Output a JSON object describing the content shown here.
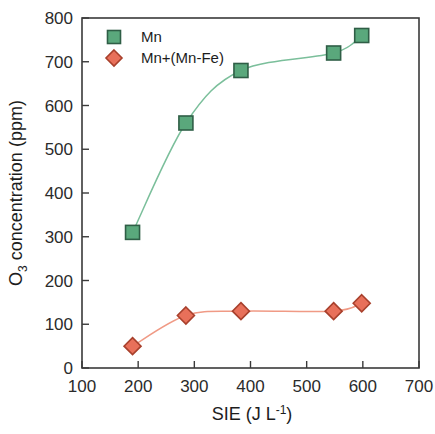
{
  "chart_data": {
    "type": "scatter",
    "title": "",
    "xlabel": "SIE (J L-1)",
    "xlabel_main": "SIE (J L",
    "xlabel_sup": "-1",
    "xlabel_close": ")",
    "ylabel": "O3 concentration (ppm)",
    "ylabel_main": "O",
    "ylabel_sub": "3",
    "ylabel_rest": " concentration (ppm)",
    "xlim": [
      100,
      700
    ],
    "ylim": [
      0,
      800
    ],
    "xticks": [
      100,
      200,
      300,
      400,
      500,
      600,
      700
    ],
    "yticks": [
      0,
      100,
      200,
      300,
      400,
      500,
      600,
      700,
      800
    ],
    "xtick_labels": [
      "100",
      "200",
      "300",
      "400",
      "500",
      "600",
      "700"
    ],
    "ytick_labels": [
      "0",
      "100",
      "200",
      "300",
      "400",
      "500",
      "600",
      "700",
      "800"
    ],
    "grid": false,
    "legend_position": "top-left",
    "series": [
      {
        "name": "Mn",
        "marker": "square",
        "color": "#5aa87c",
        "edge_color": "#2f5e46",
        "line_color": "#7bbf9b",
        "x": [
          190,
          285,
          383,
          548,
          598
        ],
        "y": [
          310,
          560,
          680,
          720,
          760
        ]
      },
      {
        "name": "Mn+(Mn-Fe)",
        "marker": "diamond",
        "color": "#e8705a",
        "edge_color": "#a8402c",
        "line_color": "#f09a85",
        "x": [
          190,
          285,
          383,
          548,
          598
        ],
        "y": [
          50,
          120,
          130,
          130,
          148
        ]
      }
    ]
  },
  "legend": {
    "items": [
      {
        "label": "Mn",
        "marker": "square",
        "color": "#5aa87c"
      },
      {
        "label": "Mn+(Mn-Fe)",
        "marker": "diamond",
        "color": "#e8705a"
      }
    ]
  },
  "colors": {
    "green": "#5aa87c",
    "green_edge": "#2f5e46",
    "green_line": "#7bbf9b",
    "red": "#e8705a",
    "red_edge": "#a8402c",
    "red_line": "#f09a85",
    "axis": "#3a3a3a",
    "text": "#1d1d1d",
    "background": "#ffffff"
  }
}
